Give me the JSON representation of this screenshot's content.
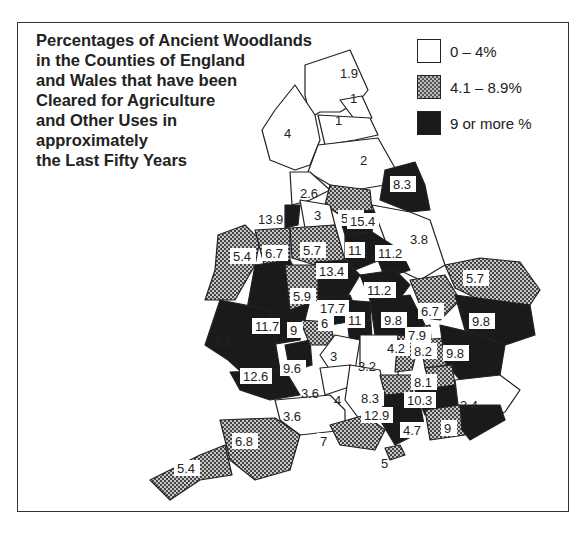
{
  "title_lines": [
    "Percentages of Ancient Woodlands",
    "in the Counties of England",
    "and Wales that have been",
    "Cleared for Agriculture",
    "and Other Uses in",
    "approximately",
    "the Last Fifty Years"
  ],
  "legend": [
    {
      "label": "0 – 4%",
      "pattern": "white"
    },
    {
      "label": "4.1 – 8.9%",
      "pattern": "checkered"
    },
    {
      "label": "9 or more %",
      "pattern": "black"
    }
  ],
  "colors": {
    "low": "#ffffff",
    "mid": "#9a9a9a",
    "high": "#1a1a1a",
    "border": "#222222"
  },
  "regions": [
    {
      "value": "1.9",
      "cls": "low"
    },
    {
      "value": "1",
      "cls": "low"
    },
    {
      "value": "4",
      "cls": "low"
    },
    {
      "value": "1",
      "cls": "low"
    },
    {
      "value": "2",
      "cls": "low"
    },
    {
      "value": "8.3",
      "cls": "high"
    },
    {
      "value": "2.6",
      "cls": "low"
    },
    {
      "value": "5.2",
      "cls": "mid"
    },
    {
      "value": "13.9",
      "cls": "high"
    },
    {
      "value": "3",
      "cls": "low"
    },
    {
      "value": "15.4",
      "cls": "high"
    },
    {
      "value": "3.8",
      "cls": "low"
    },
    {
      "value": "5.4",
      "cls": "mid"
    },
    {
      "value": "6.7",
      "cls": "mid"
    },
    {
      "value": "5.7",
      "cls": "mid"
    },
    {
      "value": "11",
      "cls": "high"
    },
    {
      "value": "11.2",
      "cls": "high"
    },
    {
      "value": "13.4",
      "cls": "high"
    },
    {
      "value": "5.7",
      "cls": "mid"
    },
    {
      "value": "5.9",
      "cls": "mid"
    },
    {
      "value": "11.2",
      "cls": "high"
    },
    {
      "value": "17.7",
      "cls": "high"
    },
    {
      "value": "6.7",
      "cls": "mid"
    },
    {
      "value": "6",
      "cls": "mid"
    },
    {
      "value": "11",
      "cls": "high"
    },
    {
      "value": "9.8",
      "cls": "high"
    },
    {
      "value": "9.8",
      "cls": "high"
    },
    {
      "value": "11.7",
      "cls": "high"
    },
    {
      "value": "9",
      "cls": "high"
    },
    {
      "value": "7.9",
      "cls": "mid"
    },
    {
      "value": "2.5",
      "cls": "low"
    },
    {
      "value": "4.2",
      "cls": "mid"
    },
    {
      "value": "8.2",
      "cls": "mid"
    },
    {
      "value": "9.8",
      "cls": "high"
    },
    {
      "value": "3",
      "cls": "low"
    },
    {
      "value": "3.2",
      "cls": "low"
    },
    {
      "value": "12.6",
      "cls": "high"
    },
    {
      "value": "9.6",
      "cls": "high"
    },
    {
      "value": "8.1",
      "cls": "mid"
    },
    {
      "value": "3.6",
      "cls": "low"
    },
    {
      "value": "8.3",
      "cls": "mid"
    },
    {
      "value": "4",
      "cls": "low"
    },
    {
      "value": "10.3",
      "cls": "high"
    },
    {
      "value": "3.4",
      "cls": "low"
    },
    {
      "value": "3.6",
      "cls": "low"
    },
    {
      "value": "12.9",
      "cls": "high"
    },
    {
      "value": "4.7",
      "cls": "mid"
    },
    {
      "value": "9",
      "cls": "high"
    },
    {
      "value": "6.8",
      "cls": "mid"
    },
    {
      "value": "7",
      "cls": "mid"
    },
    {
      "value": "5.4",
      "cls": "mid"
    },
    {
      "value": "5",
      "cls": "mid"
    }
  ]
}
